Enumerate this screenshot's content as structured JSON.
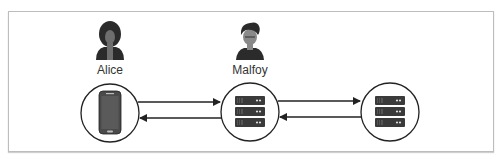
{
  "diagram": {
    "nodes": [
      {
        "id": "alice",
        "label": "Alice",
        "person_icon": "woman-avatar-icon",
        "device_icon": "smartphone-icon"
      },
      {
        "id": "malfoy",
        "label": "Malfoy",
        "person_icon": "man-avatar-icon",
        "device_icon": "server-stack-icon"
      },
      {
        "id": "server",
        "label": "",
        "device_icon": "server-stack-icon"
      }
    ],
    "edges": [
      {
        "from": "alice",
        "to": "malfoy",
        "direction": "right"
      },
      {
        "from": "malfoy",
        "to": "alice",
        "direction": "left"
      },
      {
        "from": "malfoy",
        "to": "server",
        "direction": "right"
      },
      {
        "from": "server",
        "to": "malfoy",
        "direction": "left"
      }
    ],
    "colors": {
      "stroke": "#222222",
      "icon_fill": "#3a3a3a",
      "frame": "#bdbdbd"
    }
  }
}
